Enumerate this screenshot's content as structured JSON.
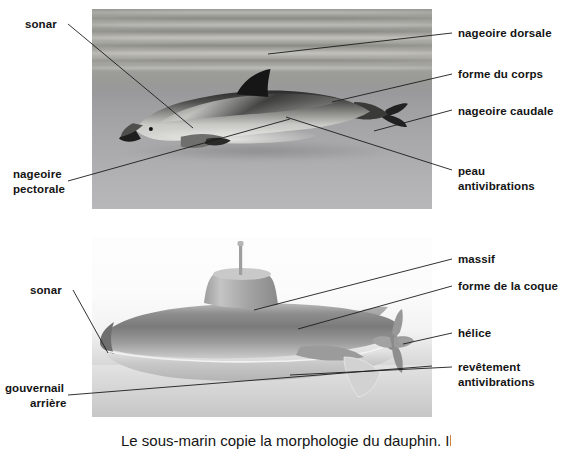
{
  "page": {
    "background_color": "#ffffff",
    "text_color": "#141414",
    "leader_line_color": "#1c1c1c"
  },
  "figures": [
    {
      "id": "dolphin",
      "name": "dolphin-photo",
      "kind": "photograph",
      "subject": "dauphin nageant sous l'eau",
      "alt": "Photographie en niveaux de gris d'un dauphin nageant sous la surface de la mer",
      "x": 92,
      "y": 9,
      "width": 340,
      "height": 200
    },
    {
      "id": "submarine",
      "name": "submarine-illustration",
      "kind": "illustration",
      "subject": "sous-marin",
      "alt": "Illustration en niveaux de gris d'un sous-marin vu de profil avec massif, helice et gouvernails",
      "x": 92,
      "y": 237,
      "width": 340,
      "height": 180
    }
  ],
  "dolphin_labels": {
    "sonar": "sonar",
    "nageoire_pectorale_line1": "nageoire",
    "nageoire_pectorale_line2": "pectorale",
    "nageoire_dorsale": "nageoire dorsale",
    "forme_du_corps": "forme du corps",
    "nageoire_caudale": "nageoire caudale",
    "peau_line1": "peau",
    "peau_line2": "antivibrations"
  },
  "submarine_labels": {
    "sonar": "sonar",
    "gouvernail_line1": "gouvernail",
    "gouvernail_line2": "arrière",
    "massif": "massif",
    "forme_de_la_coque": "forme de la coque",
    "helice": "hélice",
    "revetement_line1": "revêtement",
    "revetement_line2": "antivibrations"
  },
  "caption": {
    "clipped_text": "Le sous-marin copie la morphologie du dauphin. Il est très",
    "note": "ligne de texte coupée en bas de l'image"
  }
}
